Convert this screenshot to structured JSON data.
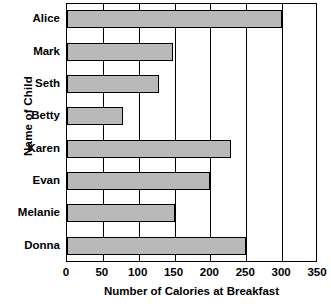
{
  "chart_data": {
    "type": "bar",
    "orientation": "horizontal",
    "title": "",
    "xlabel": "Number of Calories at Breakfast",
    "ylabel": "Name of Child",
    "categories": [
      "Alice",
      "Mark",
      "Seth",
      "Betty",
      "Karen",
      "Evan",
      "Melanie",
      "Donna"
    ],
    "values": [
      300,
      148,
      128,
      78,
      228,
      200,
      150,
      250
    ],
    "xlim": [
      0,
      350
    ],
    "xticks": [
      0,
      50,
      100,
      150,
      200,
      250,
      300,
      350
    ],
    "xticklabels": [
      "0",
      "50",
      "100",
      "150",
      "200",
      "250",
      "300",
      "350"
    ],
    "grid": "vertical",
    "legend": "none",
    "bar_fill_color": "#b9b9b9",
    "bar_edge_color": "#000000",
    "background_color": "#ffffff"
  }
}
